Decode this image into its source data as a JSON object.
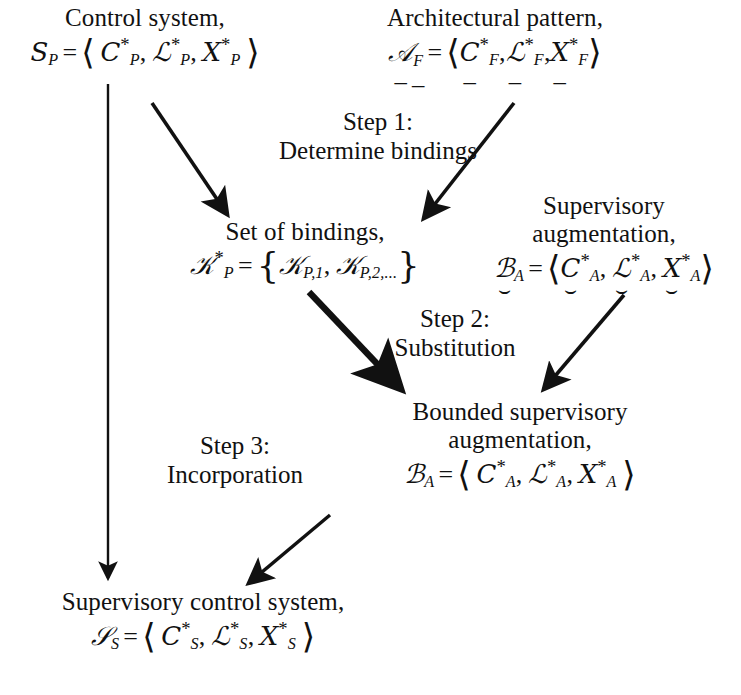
{
  "diagram": {
    "stroke_color": "#111111",
    "background_color": "#ffffff"
  },
  "nodes": {
    "control_system": {
      "label": "Control system,",
      "symbol": "S",
      "symbol_sub": "P",
      "equals": "=",
      "open": "⟨",
      "close": "⟩",
      "components": [
        {
          "base": "C",
          "star": "*",
          "sub": "P",
          "mark": "none"
        },
        {
          "base": "ℒ",
          "star": "*",
          "sub": "P",
          "mark": "none"
        },
        {
          "base": "𝑋",
          "star": "*",
          "sub": "P",
          "mark": "none"
        }
      ],
      "comma": ","
    },
    "architectural_pattern": {
      "label": "Architectural pattern,",
      "symbol": "𝒜",
      "symbol_sub": "F",
      "symbol_mark": "underline",
      "equals": "=",
      "open": "⟨",
      "close": "⟩",
      "components": [
        {
          "base": "C",
          "star": "*",
          "sub": "F",
          "mark": "underline"
        },
        {
          "base": "ℒ",
          "star": "*",
          "sub": "F",
          "mark": "underline"
        },
        {
          "base": "𝑋",
          "star": "*",
          "sub": "F",
          "mark": "underline"
        }
      ],
      "comma": ","
    },
    "set_of_bindings": {
      "label": "Set of bindings,",
      "symbol": "𝒦",
      "symbol_star": "*",
      "symbol_sub": "P",
      "equals": "=",
      "open": "{",
      "close": "}",
      "elements": [
        {
          "base": "𝒦",
          "sub": "P,1"
        },
        {
          "base": "𝒦",
          "sub": "P,2,..."
        }
      ],
      "comma": ","
    },
    "supervisory_augmentation": {
      "label_line1": "Supervisory",
      "label_line2": "augmentation,",
      "symbol": "ℬ",
      "symbol_sub": "A",
      "symbol_mark": "cup",
      "equals": "=",
      "open": "⟨",
      "close": "⟩",
      "components": [
        {
          "base": "C",
          "star": "*",
          "sub": "A",
          "mark": "cup"
        },
        {
          "base": "ℒ",
          "star": "*",
          "sub": "A",
          "mark": "cup"
        },
        {
          "base": "𝑋",
          "star": "*",
          "sub": "A",
          "mark": "cup"
        }
      ],
      "comma": ","
    },
    "bounded_supervisory_augmentation": {
      "label_line1": "Bounded supervisory",
      "label_line2": "augmentation,",
      "symbol": "ℬ",
      "symbol_sub": "A",
      "equals": "=",
      "open": "⟨",
      "close": "⟩",
      "components": [
        {
          "base": "C",
          "star": "*",
          "sub": "A",
          "mark": "none"
        },
        {
          "base": "ℒ",
          "star": "*",
          "sub": "A",
          "mark": "none"
        },
        {
          "base": "𝑋",
          "star": "*",
          "sub": "A",
          "mark": "none"
        }
      ],
      "comma": ","
    },
    "supervisory_control_system": {
      "label": "Supervisory control system,",
      "symbol": "𝒮",
      "symbol_sub": "S",
      "equals": "=",
      "open": "⟨",
      "close": "⟩",
      "components": [
        {
          "base": "C",
          "star": "*",
          "sub": "S",
          "mark": "none"
        },
        {
          "base": "ℒ",
          "star": "*",
          "sub": "S",
          "mark": "none"
        },
        {
          "base": "𝑋",
          "star": "*",
          "sub": "S",
          "mark": "none"
        }
      ],
      "comma": ","
    }
  },
  "steps": [
    {
      "id": "step-1",
      "line1": "Step 1:",
      "line2": "Determine bindings"
    },
    {
      "id": "step-2",
      "line1": "Step 2:",
      "line2": "Substitution"
    },
    {
      "id": "step-3",
      "line1": "Step 3:",
      "line2": "Incorporation"
    }
  ],
  "edges": [
    {
      "name": "control-system-to-supervisory-control-system",
      "style": "thin-vertical"
    },
    {
      "name": "control-system-to-set-of-bindings",
      "style": "thin-diagonal"
    },
    {
      "name": "architectural-pattern-to-set-of-bindings",
      "style": "thin-diagonal"
    },
    {
      "name": "set-of-bindings-to-bounded-supervisory-augmentation",
      "style": "thick-diagonal"
    },
    {
      "name": "supervisory-augmentation-to-bounded-supervisory-augmentation",
      "style": "thin-diagonal"
    },
    {
      "name": "bounded-supervisory-augmentation-to-supervisory-control-system",
      "style": "thin-diagonal"
    }
  ]
}
